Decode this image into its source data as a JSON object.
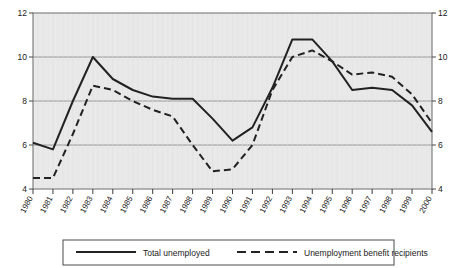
{
  "chart_data": {
    "type": "line",
    "title": "",
    "subtitle": "",
    "xlabel": "",
    "ylabel": "",
    "ylim": [
      4,
      12
    ],
    "yticks": [
      4,
      6,
      8,
      10,
      12
    ],
    "ytick_labels_left": [
      "4",
      "6",
      "8",
      "10",
      "12"
    ],
    "ytick_labels_right": [
      "4",
      "6",
      "8",
      "10",
      "12"
    ],
    "grid": true,
    "grid_axis": "y",
    "legend_position": "bottom",
    "plot_background": "#e9e9e9",
    "categories": [
      "1980",
      "1981",
      "1982",
      "1983",
      "1984",
      "1985",
      "1986",
      "1987",
      "1988",
      "1989",
      "1990",
      "1991",
      "1992",
      "1993",
      "1994",
      "1995",
      "1996",
      "1997",
      "1998",
      "1999",
      "2000"
    ],
    "x": [
      1980,
      1981,
      1982,
      1983,
      1984,
      1985,
      1986,
      1987,
      1988,
      1989,
      1990,
      1991,
      1992,
      1993,
      1994,
      1995,
      1996,
      1997,
      1998,
      1999,
      2000
    ],
    "series": [
      {
        "name": "Total unemployed",
        "style": "solid",
        "color": "#222222",
        "values": [
          6.1,
          5.8,
          8.0,
          10.0,
          9.0,
          8.5,
          8.2,
          8.1,
          8.1,
          7.2,
          6.2,
          6.8,
          8.6,
          10.8,
          10.8,
          9.8,
          8.5,
          8.6,
          8.5,
          7.8,
          6.6
        ]
      },
      {
        "name": "Unemployment benefit recipients",
        "style": "dashed",
        "color": "#222222",
        "values": [
          4.5,
          4.5,
          6.5,
          8.7,
          8.5,
          8.0,
          7.6,
          7.3,
          6.0,
          4.8,
          4.9,
          6.0,
          8.5,
          10.0,
          10.3,
          9.8,
          9.2,
          9.3,
          9.1,
          8.3,
          7.0
        ]
      }
    ]
  },
  "legend": {
    "items": [
      {
        "label": "Total unemployed",
        "style": "solid"
      },
      {
        "label": "Unemployment benefit recipients",
        "style": "dashed"
      }
    ]
  }
}
